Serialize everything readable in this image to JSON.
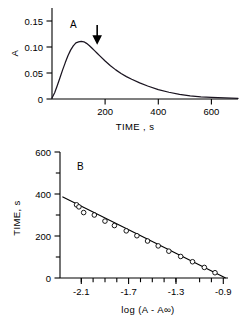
{
  "figure": {
    "panels": [
      {
        "id": "A",
        "label": "A",
        "xlabel": "TIME , s",
        "ylabel": "A",
        "annotation_arrow_label": "arrow-marker"
      },
      {
        "id": "B",
        "label": "B",
        "xlabel": "log (A - A∞)",
        "ylabel": "TIME, s"
      }
    ]
  },
  "chart_data": [
    {
      "type": "line",
      "panel": "A",
      "title": "A",
      "xlabel": "TIME , s",
      "ylabel": "A",
      "xlim": [
        0,
        700
      ],
      "ylim": [
        0,
        0.175
      ],
      "xticks": [
        0,
        200,
        400,
        600
      ],
      "xticklabels": [
        "",
        "200",
        "400",
        "600"
      ],
      "yticks": [
        0,
        0.05,
        0.1,
        0.15
      ],
      "yticklabels": [
        "0",
        "0.05",
        "0.10",
        "0.15"
      ],
      "grid": false,
      "legend": "none",
      "annotations": [
        {
          "type": "arrow",
          "direction": "down",
          "x": 170,
          "y": 0.135,
          "label": ""
        }
      ],
      "series": [
        {
          "name": "absorbance trace",
          "x": [
            0,
            10,
            20,
            30,
            40,
            50,
            60,
            70,
            80,
            90,
            100,
            110,
            120,
            130,
            140,
            150,
            160,
            170,
            180,
            200,
            220,
            240,
            260,
            280,
            300,
            330,
            360,
            400,
            440,
            480,
            520,
            560,
            600,
            650,
            700
          ],
          "y": [
            0.002,
            0.012,
            0.026,
            0.041,
            0.056,
            0.07,
            0.083,
            0.094,
            0.102,
            0.108,
            0.11,
            0.111,
            0.11,
            0.107,
            0.103,
            0.098,
            0.093,
            0.088,
            0.083,
            0.073,
            0.064,
            0.056,
            0.049,
            0.043,
            0.038,
            0.031,
            0.025,
            0.018,
            0.013,
            0.009,
            0.006,
            0.004,
            0.003,
            0.002,
            0.001
          ]
        }
      ]
    },
    {
      "type": "scatter",
      "panel": "B",
      "title": "B",
      "xlabel": "log (A - A∞)",
      "ylabel": "TIME, s",
      "xlim": [
        -2.28,
        -0.86
      ],
      "ylim": [
        0,
        620
      ],
      "xticks": [
        -2.1,
        -1.7,
        -1.3,
        -0.9
      ],
      "xticklabels": [
        "-2.1",
        "-1.7",
        "-1.3",
        "-0.9"
      ],
      "yticks": [
        0,
        100,
        200,
        300,
        400,
        500,
        600
      ],
      "yticklabels": [
        "0",
        "",
        "200",
        "",
        "400",
        "",
        "600"
      ],
      "grid": false,
      "legend": "none",
      "marker": "open-circle",
      "points": [
        {
          "x": -2.14,
          "y": 360
        },
        {
          "x": -2.12,
          "y": 350
        },
        {
          "x": -2.08,
          "y": 322
        },
        {
          "x": -1.99,
          "y": 310
        },
        {
          "x": -1.9,
          "y": 280
        },
        {
          "x": -1.82,
          "y": 258
        },
        {
          "x": -1.72,
          "y": 232
        },
        {
          "x": -1.63,
          "y": 208
        },
        {
          "x": -1.54,
          "y": 182
        },
        {
          "x": -1.45,
          "y": 158
        },
        {
          "x": -1.36,
          "y": 132
        },
        {
          "x": -1.26,
          "y": 106
        },
        {
          "x": -1.16,
          "y": 80
        },
        {
          "x": -1.06,
          "y": 52
        },
        {
          "x": -0.97,
          "y": 26
        }
      ],
      "fit_line": {
        "x": [
          -2.26,
          -0.88
        ],
        "y": [
          400,
          0
        ],
        "style": "solid"
      }
    }
  ]
}
